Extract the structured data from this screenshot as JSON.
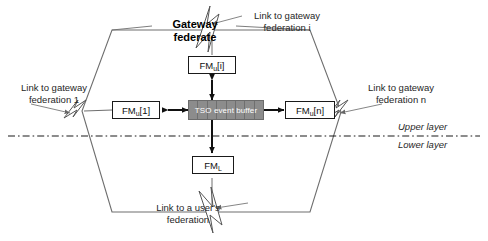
{
  "diagram": {
    "title": "Gateway federate",
    "boundary_shape": "hexagon",
    "central_buffer": {
      "label": "TSO event buffer",
      "fill": "#8c8c8c",
      "text_color": "#ffffff",
      "segments": 8
    },
    "nodes": [
      {
        "id": "fm-u-i",
        "base": "FM",
        "subscript": "u",
        "index": "[i]",
        "label": "FMu[i]",
        "position": "top"
      },
      {
        "id": "fm-u-1",
        "base": "FM",
        "subscript": "u",
        "index": "[1]",
        "label": "FMu[1]",
        "position": "left"
      },
      {
        "id": "fm-u-n",
        "base": "FM",
        "subscript": "u",
        "index": "[n]",
        "label": "FMu[n]",
        "position": "right"
      },
      {
        "id": "fm-l",
        "base": "FM",
        "subscript": "L",
        "index": "",
        "label": "FML",
        "position": "bottom"
      }
    ],
    "link_labels": [
      {
        "id": "link-gateway-federation-i",
        "text": "Link to gateway\nfederation i",
        "anchor": "top"
      },
      {
        "id": "link-gateway-federation-1",
        "text": "Link to gateway\nfederation  1",
        "anchor": "left"
      },
      {
        "id": "link-gateway-federation-n",
        "text": "Link to gateway\nfederation n",
        "anchor": "right"
      },
      {
        "id": "link-users-federation",
        "text": "Link to a user's\nfederation",
        "anchor": "bottom"
      }
    ],
    "layer_divider": {
      "style": "dash-dot",
      "upper_label": "Upper layer",
      "lower_label": "Lower layer"
    },
    "colors": {
      "line": "#1a1a1a",
      "outline": "#6e6e6e",
      "buffer_fill": "#8c8c8c",
      "background": "#ffffff"
    }
  }
}
